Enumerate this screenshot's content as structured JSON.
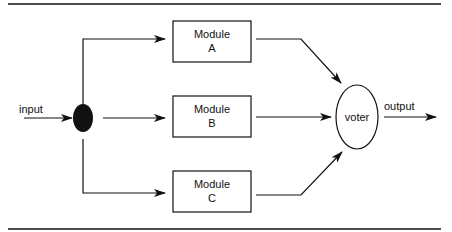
{
  "diagram": {
    "input_label": "input",
    "output_label": "output",
    "voter_label": "voter",
    "modules": [
      {
        "line1": "Module",
        "line2": "A"
      },
      {
        "line1": "Module",
        "line2": "B"
      },
      {
        "line1": "Module",
        "line2": "C"
      }
    ],
    "colors": {
      "stroke": "#111111",
      "background": "#ffffff"
    }
  }
}
